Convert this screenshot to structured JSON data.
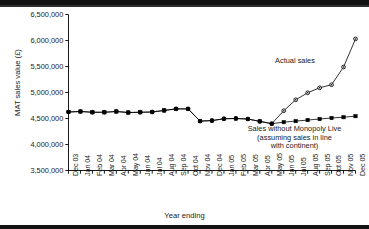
{
  "chart_data": {
    "type": "line",
    "title": "",
    "xlabel": "Year ending",
    "ylabel": "MAT sales value (£)",
    "ylim": [
      3500000,
      6500000
    ],
    "ytick_labels": [
      "6,500,000",
      "6,000,000",
      "5,500,000",
      "5,000,000",
      "4,500,000",
      "4,000,000",
      "3,500,000"
    ],
    "ytick_values": [
      6500000,
      6000000,
      5500000,
      5000000,
      4500000,
      4000000,
      3500000
    ],
    "grid": false,
    "legend_position": "inline-annotations",
    "categories": [
      "Dec 03",
      "Jan 04",
      "Feb 04",
      "Mar 04",
      "Apr 04",
      "May 04",
      "Jun 04",
      "Jul 04",
      "Aug 04",
      "Sep 04",
      "Oct 04",
      "Nov 04",
      "Dec 04",
      "Jan 05",
      "Feb 05",
      "Mar 05",
      "Apr 05",
      "May 05",
      "Jun 05",
      "Jul 05",
      "Aug 05",
      "Sep 05",
      "Oct 05",
      "Nov 05",
      "Dec 05"
    ],
    "series": [
      {
        "name": "Actual sales",
        "marker": "circle",
        "values": [
          4625000,
          4635000,
          4620000,
          4620000,
          4635000,
          4615000,
          4620000,
          4625000,
          4655000,
          4685000,
          4685000,
          4450000,
          4460000,
          4495000,
          4500000,
          4490000,
          4445000,
          4400000,
          4650000,
          4860000,
          4995000,
          5090000,
          5150000,
          5490000,
          6030000
        ]
      },
      {
        "name": "Sales without Monopoly Live (assuming sales in line with continent)",
        "marker": "square",
        "values": [
          4625000,
          4635000,
          4620000,
          4620000,
          4635000,
          4615000,
          4620000,
          4625000,
          4655000,
          4685000,
          4685000,
          4450000,
          4460000,
          4495000,
          4500000,
          4490000,
          4445000,
          4400000,
          4430000,
          4450000,
          4470000,
          4490000,
          4510000,
          4525000,
          4545000
        ]
      }
    ],
    "annotations": [
      {
        "id": "actual",
        "text": "Actual sales"
      },
      {
        "id": "baseline_l1",
        "text": "Sales without Monopoly Live"
      },
      {
        "id": "baseline_l2",
        "text": "(assuming sales in line"
      },
      {
        "id": "baseline_l3",
        "text": "with continent)"
      }
    ]
  },
  "colors": {
    "line": "#000000",
    "axis": "#000000",
    "text": "#1a1a1a",
    "background": "#ffffff"
  }
}
